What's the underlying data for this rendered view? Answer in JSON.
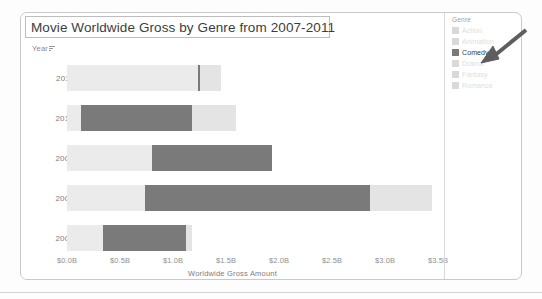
{
  "chart_data": {
    "type": "bar",
    "subtype": "stacked-horizontal",
    "title": "Movie Worldwide Gross by Genre from 2007-2011",
    "xlabel": "Worldwide Gross Amount",
    "ylabel": "Year",
    "categories": [
      "2011",
      "2010",
      "2009",
      "2008",
      "2007"
    ],
    "xlim": [
      0.0,
      3.6
    ],
    "xticks": [
      "$0.0B",
      "$0.5B",
      "$1.0B",
      "$1.5B",
      "$2.0B",
      "$2.5B",
      "$3.0B",
      "$3.5B"
    ],
    "xtick_values": [
      0.0,
      0.5,
      1.0,
      1.5,
      2.0,
      2.5,
      3.0,
      3.5
    ],
    "grid": false,
    "legend": {
      "title": "Genre",
      "position": "right",
      "entries": [
        {
          "label": "Action",
          "color": "#d9d9d9",
          "state": "dimmed"
        },
        {
          "label": "Animation",
          "color": "#d9d9d9",
          "state": "dimmed"
        },
        {
          "label": "Comedy",
          "color": "#7a7a7a",
          "state": "highlighted"
        },
        {
          "label": "Drama",
          "color": "#d9d9d9",
          "state": "dimmed"
        },
        {
          "label": "Fantasy",
          "color": "#d9d9d9",
          "state": "dimmed"
        },
        {
          "label": "Romance",
          "color": "#d9d9d9",
          "state": "dimmed"
        }
      ]
    },
    "series": [
      {
        "name": "Other genres (before Comedy)",
        "color": "#ebebeb",
        "values": [
          1.235,
          0.132,
          0.802,
          0.736,
          0.34
        ]
      },
      {
        "name": "Comedy",
        "color": "#7a7a7a",
        "values": [
          0.019,
          1.047,
          1.132,
          2.123,
          0.783
        ]
      },
      {
        "name": "Other genres (after Comedy)",
        "color": "#e4e4e4",
        "values": [
          0.198,
          0.415,
          0.0,
          0.585,
          0.057
        ]
      }
    ],
    "bars": [
      {
        "year": "2011",
        "segments": [
          {
            "genre": "other-before",
            "start": 0.0,
            "end": 1.235,
            "color": "#ebebeb"
          },
          {
            "genre": "Comedy",
            "start": 1.235,
            "end": 1.254,
            "color": "#7a7a7a"
          },
          {
            "genre": "other-after",
            "start": 1.254,
            "end": 1.452,
            "color": "#e4e4e4"
          }
        ]
      },
      {
        "year": "2010",
        "segments": [
          {
            "genre": "other-before",
            "start": 0.0,
            "end": 0.132,
            "color": "#ebebeb"
          },
          {
            "genre": "Comedy",
            "start": 0.132,
            "end": 1.179,
            "color": "#7a7a7a"
          },
          {
            "genre": "other-after",
            "start": 1.179,
            "end": 1.594,
            "color": "#e4e4e4"
          }
        ]
      },
      {
        "year": "2009",
        "segments": [
          {
            "genre": "other-before",
            "start": 0.0,
            "end": 0.802,
            "color": "#ebebeb"
          },
          {
            "genre": "Comedy",
            "start": 0.802,
            "end": 1.934,
            "color": "#7a7a7a"
          }
        ]
      },
      {
        "year": "2008",
        "segments": [
          {
            "genre": "other-before",
            "start": 0.0,
            "end": 0.736,
            "color": "#ebebeb"
          },
          {
            "genre": "Comedy",
            "start": 0.736,
            "end": 2.859,
            "color": "#7a7a7a"
          },
          {
            "genre": "other-after",
            "start": 2.859,
            "end": 3.444,
            "color": "#e4e4e4"
          }
        ]
      },
      {
        "year": "2007",
        "segments": [
          {
            "genre": "other-before",
            "start": 0.0,
            "end": 0.34,
            "color": "#ebebeb"
          },
          {
            "genre": "Comedy",
            "start": 0.34,
            "end": 1.123,
            "color": "#7a7a7a"
          },
          {
            "genre": "other-after",
            "start": 1.123,
            "end": 1.179,
            "color": "#e4e4e4"
          }
        ]
      }
    ]
  },
  "annotation": {
    "arrow": "arrow-pointing-down-left",
    "target": "Comedy"
  }
}
